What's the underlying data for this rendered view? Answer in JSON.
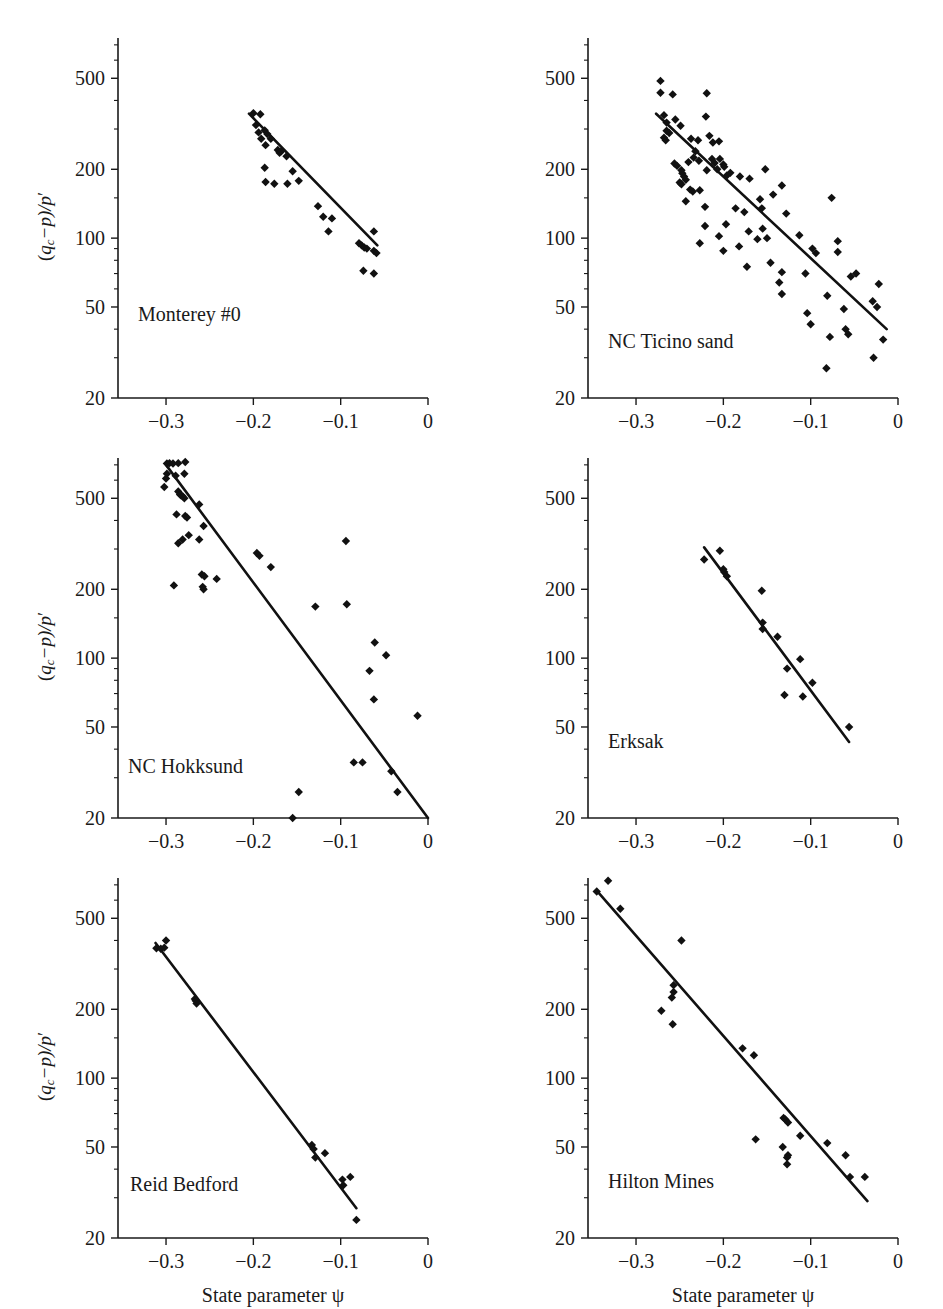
{
  "figure": {
    "ylabel_parts": {
      "lead": "(q",
      "sub": "c",
      "mid": "−p)/p",
      "prime": "′"
    },
    "xlabel": "State parameter ψ",
    "axis_color": "#1a1a1a",
    "point_color": "#111111",
    "line_color": "#111111"
  },
  "axes": {
    "y_ticks_major": [
      20,
      50,
      100,
      200,
      500
    ],
    "y_tick_labels": [
      "20",
      "50",
      "100",
      "200",
      "500"
    ],
    "y_minor_ticks": [
      30,
      40,
      60,
      70,
      80,
      90,
      150,
      300,
      400,
      600,
      700
    ],
    "ylim": [
      20,
      750
    ],
    "x_ticks_major": [
      -0.3,
      -0.2,
      -0.1,
      0
    ],
    "x_tick_labels": [
      "−0.3",
      "−0.2",
      "−0.1",
      "0"
    ],
    "xlim": [
      -0.355,
      0.0
    ],
    "scale_y": "log",
    "scale_x": "linear",
    "grid": false
  },
  "chart_data": {
    "type": "scatter",
    "title": "",
    "xlabel": "State parameter ψ",
    "ylabel": "(q_c−p)/p′",
    "xlim": [
      -0.355,
      0.0
    ],
    "ylim": [
      20,
      750
    ],
    "yscale": "log",
    "grid": false,
    "legend": "none",
    "panels": [
      {
        "label": "Monterey #0",
        "row": 0,
        "col": 0,
        "fit_line": {
          "x": [
            -0.205,
            -0.058
          ],
          "y": [
            350,
            93
          ]
        },
        "points": [
          {
            "x": -0.2,
            "y": 352
          },
          {
            "x": -0.192,
            "y": 348
          },
          {
            "x": -0.197,
            "y": 312
          },
          {
            "x": -0.194,
            "y": 290
          },
          {
            "x": -0.187,
            "y": 296
          },
          {
            "x": -0.184,
            "y": 285
          },
          {
            "x": -0.191,
            "y": 272
          },
          {
            "x": -0.18,
            "y": 272
          },
          {
            "x": -0.186,
            "y": 255
          },
          {
            "x": -0.172,
            "y": 243
          },
          {
            "x": -0.168,
            "y": 240
          },
          {
            "x": -0.17,
            "y": 236
          },
          {
            "x": -0.162,
            "y": 228
          },
          {
            "x": -0.187,
            "y": 203
          },
          {
            "x": -0.155,
            "y": 196
          },
          {
            "x": -0.186,
            "y": 176
          },
          {
            "x": -0.176,
            "y": 173
          },
          {
            "x": -0.161,
            "y": 173
          },
          {
            "x": -0.148,
            "y": 178
          },
          {
            "x": -0.126,
            "y": 138
          },
          {
            "x": -0.12,
            "y": 124
          },
          {
            "x": -0.11,
            "y": 122
          },
          {
            "x": -0.114,
            "y": 107
          },
          {
            "x": -0.079,
            "y": 95
          },
          {
            "x": -0.076,
            "y": 93
          },
          {
            "x": -0.073,
            "y": 91
          },
          {
            "x": -0.07,
            "y": 90
          },
          {
            "x": -0.062,
            "y": 107
          },
          {
            "x": -0.062,
            "y": 88
          },
          {
            "x": -0.059,
            "y": 86
          },
          {
            "x": -0.074,
            "y": 72
          },
          {
            "x": -0.062,
            "y": 70
          }
        ]
      },
      {
        "label": "NC Ticino sand",
        "row": 0,
        "col": 1,
        "fit_line": {
          "x": [
            -0.277,
            -0.013
          ],
          "y": [
            350,
            40
          ]
        },
        "points": [
          {
            "x": -0.272,
            "y": 487
          },
          {
            "x": -0.272,
            "y": 432
          },
          {
            "x": -0.258,
            "y": 425
          },
          {
            "x": -0.219,
            "y": 430
          },
          {
            "x": -0.268,
            "y": 345
          },
          {
            "x": -0.265,
            "y": 320
          },
          {
            "x": -0.255,
            "y": 330
          },
          {
            "x": -0.249,
            "y": 310
          },
          {
            "x": -0.22,
            "y": 340
          },
          {
            "x": -0.265,
            "y": 295
          },
          {
            "x": -0.262,
            "y": 288
          },
          {
            "x": -0.268,
            "y": 275
          },
          {
            "x": -0.266,
            "y": 268
          },
          {
            "x": -0.237,
            "y": 272
          },
          {
            "x": -0.229,
            "y": 268
          },
          {
            "x": -0.216,
            "y": 280
          },
          {
            "x": -0.212,
            "y": 262
          },
          {
            "x": -0.205,
            "y": 265
          },
          {
            "x": -0.232,
            "y": 240
          },
          {
            "x": -0.24,
            "y": 215
          },
          {
            "x": -0.256,
            "y": 212
          },
          {
            "x": -0.253,
            "y": 207
          },
          {
            "x": -0.234,
            "y": 225
          },
          {
            "x": -0.228,
            "y": 218
          },
          {
            "x": -0.213,
            "y": 222
          },
          {
            "x": -0.21,
            "y": 213
          },
          {
            "x": -0.204,
            "y": 222
          },
          {
            "x": -0.2,
            "y": 210
          },
          {
            "x": -0.248,
            "y": 198
          },
          {
            "x": -0.247,
            "y": 192
          },
          {
            "x": -0.245,
            "y": 186
          },
          {
            "x": -0.243,
            "y": 180
          },
          {
            "x": -0.25,
            "y": 175
          },
          {
            "x": -0.248,
            "y": 172
          },
          {
            "x": -0.219,
            "y": 198
          },
          {
            "x": -0.207,
            "y": 200
          },
          {
            "x": -0.199,
            "y": 205
          },
          {
            "x": -0.196,
            "y": 188
          },
          {
            "x": -0.192,
            "y": 193
          },
          {
            "x": -0.181,
            "y": 186
          },
          {
            "x": -0.238,
            "y": 163
          },
          {
            "x": -0.235,
            "y": 160
          },
          {
            "x": -0.227,
            "y": 162
          },
          {
            "x": -0.243,
            "y": 145
          },
          {
            "x": -0.17,
            "y": 182
          },
          {
            "x": -0.152,
            "y": 200
          },
          {
            "x": -0.133,
            "y": 170
          },
          {
            "x": -0.143,
            "y": 155
          },
          {
            "x": -0.158,
            "y": 148
          },
          {
            "x": -0.156,
            "y": 135
          },
          {
            "x": -0.221,
            "y": 137
          },
          {
            "x": -0.186,
            "y": 135
          },
          {
            "x": -0.176,
            "y": 130
          },
          {
            "x": -0.128,
            "y": 128
          },
          {
            "x": -0.076,
            "y": 150
          },
          {
            "x": -0.221,
            "y": 113
          },
          {
            "x": -0.197,
            "y": 115
          },
          {
            "x": -0.171,
            "y": 107
          },
          {
            "x": -0.155,
            "y": 110
          },
          {
            "x": -0.227,
            "y": 95
          },
          {
            "x": -0.205,
            "y": 102
          },
          {
            "x": -0.161,
            "y": 99
          },
          {
            "x": -0.15,
            "y": 100
          },
          {
            "x": -0.113,
            "y": 103
          },
          {
            "x": -0.2,
            "y": 88
          },
          {
            "x": -0.182,
            "y": 92
          },
          {
            "x": -0.098,
            "y": 90
          },
          {
            "x": -0.069,
            "y": 97
          },
          {
            "x": -0.094,
            "y": 86
          },
          {
            "x": -0.069,
            "y": 87
          },
          {
            "x": -0.173,
            "y": 75
          },
          {
            "x": -0.146,
            "y": 78
          },
          {
            "x": -0.133,
            "y": 71
          },
          {
            "x": -0.106,
            "y": 70
          },
          {
            "x": -0.136,
            "y": 64
          },
          {
            "x": -0.054,
            "y": 68
          },
          {
            "x": -0.048,
            "y": 70
          },
          {
            "x": -0.133,
            "y": 57
          },
          {
            "x": -0.081,
            "y": 56
          },
          {
            "x": -0.022,
            "y": 63
          },
          {
            "x": -0.104,
            "y": 47
          },
          {
            "x": -0.062,
            "y": 49
          },
          {
            "x": -0.029,
            "y": 53
          },
          {
            "x": -0.024,
            "y": 50
          },
          {
            "x": -0.1,
            "y": 42
          },
          {
            "x": -0.06,
            "y": 40
          },
          {
            "x": -0.057,
            "y": 38
          },
          {
            "x": -0.078,
            "y": 37
          },
          {
            "x": -0.017,
            "y": 36
          },
          {
            "x": -0.028,
            "y": 30
          },
          {
            "x": -0.082,
            "y": 27
          }
        ]
      },
      {
        "label": "NC Hokksund",
        "row": 1,
        "col": 0,
        "fit_line": {
          "x": [
            -0.3,
            0.0
          ],
          "y": [
            700,
            20
          ]
        },
        "points": [
          {
            "x": -0.299,
            "y": 710
          },
          {
            "x": -0.296,
            "y": 712
          },
          {
            "x": -0.292,
            "y": 710
          },
          {
            "x": -0.286,
            "y": 712
          },
          {
            "x": -0.278,
            "y": 720
          },
          {
            "x": -0.299,
            "y": 640
          },
          {
            "x": -0.3,
            "y": 610
          },
          {
            "x": -0.289,
            "y": 628
          },
          {
            "x": -0.279,
            "y": 640
          },
          {
            "x": -0.302,
            "y": 560
          },
          {
            "x": -0.286,
            "y": 535
          },
          {
            "x": -0.284,
            "y": 520
          },
          {
            "x": -0.283,
            "y": 515
          },
          {
            "x": -0.281,
            "y": 510
          },
          {
            "x": -0.279,
            "y": 500
          },
          {
            "x": -0.262,
            "y": 470
          },
          {
            "x": -0.288,
            "y": 425
          },
          {
            "x": -0.278,
            "y": 418
          },
          {
            "x": -0.276,
            "y": 412
          },
          {
            "x": -0.257,
            "y": 378
          },
          {
            "x": -0.281,
            "y": 330
          },
          {
            "x": -0.274,
            "y": 345
          },
          {
            "x": -0.286,
            "y": 318
          },
          {
            "x": -0.262,
            "y": 330
          },
          {
            "x": -0.094,
            "y": 325
          },
          {
            "x": -0.196,
            "y": 288
          },
          {
            "x": -0.193,
            "y": 280
          },
          {
            "x": -0.18,
            "y": 250
          },
          {
            "x": -0.259,
            "y": 232
          },
          {
            "x": -0.256,
            "y": 228
          },
          {
            "x": -0.242,
            "y": 222
          },
          {
            "x": -0.291,
            "y": 208
          },
          {
            "x": -0.258,
            "y": 205
          },
          {
            "x": -0.257,
            "y": 200
          },
          {
            "x": -0.129,
            "y": 168
          },
          {
            "x": -0.093,
            "y": 172
          },
          {
            "x": -0.061,
            "y": 117
          },
          {
            "x": -0.048,
            "y": 103
          },
          {
            "x": -0.067,
            "y": 88
          },
          {
            "x": -0.062,
            "y": 66
          },
          {
            "x": -0.012,
            "y": 56
          },
          {
            "x": -0.085,
            "y": 35
          },
          {
            "x": -0.075,
            "y": 35
          },
          {
            "x": -0.042,
            "y": 32
          },
          {
            "x": -0.148,
            "y": 26
          },
          {
            "x": -0.035,
            "y": 26
          },
          {
            "x": -0.155,
            "y": 20
          }
        ]
      },
      {
        "label": "Erksak",
        "row": 1,
        "col": 1,
        "fit_line": {
          "x": [
            -0.222,
            -0.056
          ],
          "y": [
            305,
            43
          ]
        },
        "points": [
          {
            "x": -0.204,
            "y": 295
          },
          {
            "x": -0.222,
            "y": 270
          },
          {
            "x": -0.2,
            "y": 245
          },
          {
            "x": -0.199,
            "y": 238
          },
          {
            "x": -0.196,
            "y": 228
          },
          {
            "x": -0.156,
            "y": 197
          },
          {
            "x": -0.155,
            "y": 143
          },
          {
            "x": -0.155,
            "y": 134
          },
          {
            "x": -0.138,
            "y": 124
          },
          {
            "x": -0.112,
            "y": 99
          },
          {
            "x": -0.127,
            "y": 90
          },
          {
            "x": -0.098,
            "y": 78
          },
          {
            "x": -0.13,
            "y": 69
          },
          {
            "x": -0.109,
            "y": 68
          },
          {
            "x": -0.056,
            "y": 50
          }
        ]
      },
      {
        "label": "Reid Bedford",
        "row": 2,
        "col": 0,
        "fit_line": {
          "x": [
            -0.312,
            -0.082
          ],
          "y": [
            390,
            27
          ]
        },
        "points": [
          {
            "x": -0.3,
            "y": 400
          },
          {
            "x": -0.311,
            "y": 370
          },
          {
            "x": -0.306,
            "y": 368
          },
          {
            "x": -0.302,
            "y": 372
          },
          {
            "x": -0.267,
            "y": 222
          },
          {
            "x": -0.266,
            "y": 218
          },
          {
            "x": -0.265,
            "y": 212
          },
          {
            "x": -0.133,
            "y": 51
          },
          {
            "x": -0.131,
            "y": 49
          },
          {
            "x": -0.129,
            "y": 45
          },
          {
            "x": -0.118,
            "y": 47
          },
          {
            "x": -0.098,
            "y": 36
          },
          {
            "x": -0.097,
            "y": 34
          },
          {
            "x": -0.089,
            "y": 37
          },
          {
            "x": -0.082,
            "y": 24
          }
        ]
      },
      {
        "label": "Hilton Mines",
        "row": 2,
        "col": 1,
        "fit_line": {
          "x": [
            -0.345,
            -0.035
          ],
          "y": [
            660,
            29
          ]
        },
        "points": [
          {
            "x": -0.332,
            "y": 730
          },
          {
            "x": -0.345,
            "y": 655
          },
          {
            "x": -0.318,
            "y": 550
          },
          {
            "x": -0.248,
            "y": 400
          },
          {
            "x": -0.257,
            "y": 255
          },
          {
            "x": -0.257,
            "y": 238
          },
          {
            "x": -0.259,
            "y": 225
          },
          {
            "x": -0.271,
            "y": 197
          },
          {
            "x": -0.258,
            "y": 172
          },
          {
            "x": -0.178,
            "y": 135
          },
          {
            "x": -0.165,
            "y": 126
          },
          {
            "x": -0.131,
            "y": 67
          },
          {
            "x": -0.129,
            "y": 66
          },
          {
            "x": -0.126,
            "y": 64
          },
          {
            "x": -0.112,
            "y": 56
          },
          {
            "x": -0.163,
            "y": 54
          },
          {
            "x": -0.132,
            "y": 50
          },
          {
            "x": -0.081,
            "y": 52
          },
          {
            "x": -0.126,
            "y": 46
          },
          {
            "x": -0.127,
            "y": 45
          },
          {
            "x": -0.06,
            "y": 46
          },
          {
            "x": -0.127,
            "y": 42
          },
          {
            "x": -0.055,
            "y": 37
          },
          {
            "x": -0.038,
            "y": 37
          }
        ]
      }
    ]
  }
}
